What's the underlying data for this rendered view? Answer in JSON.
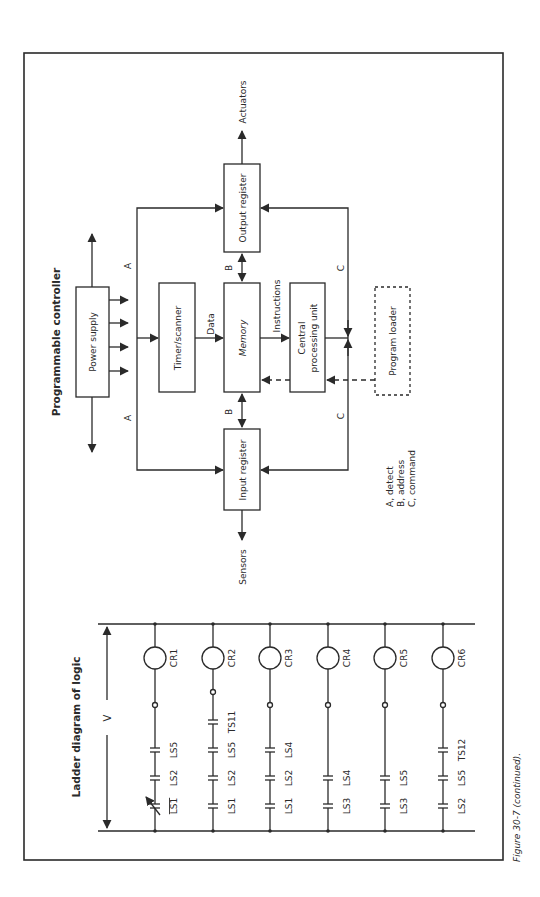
{
  "figure": {
    "caption": "Figure 30-7 (continued).",
    "colors": {
      "line": "#2a2a2a",
      "background": "#ffffff"
    }
  },
  "controller": {
    "title": "Programmable controller",
    "blocks": {
      "power_supply": "Power supply",
      "timer_scanner": "Timer/scanner",
      "memory": "Memory",
      "cpu_line1": "Central",
      "cpu_line2": "processing unit",
      "input_register": "Input register",
      "output_register": "Output register",
      "program_loader": "Program loader"
    },
    "signals": {
      "data": "Data",
      "instructions": "Instructions",
      "sensors": "Sensors",
      "actuators": "Actuators"
    },
    "bus_labels": {
      "a": "A",
      "b": "B",
      "c": "C"
    },
    "legend": [
      "A, detect",
      "B, address",
      "C, command"
    ]
  },
  "ladder": {
    "title": "Ladder diagram of logic",
    "voltage_label": "V",
    "rungs": [
      {
        "coil": "CR1",
        "contacts": [
          "LS1",
          "LS2",
          "LS5"
        ],
        "first_contact_normally_closed": true
      },
      {
        "coil": "CR2",
        "contacts": [
          "LS1",
          "LS2",
          "LS5",
          "TS11"
        ]
      },
      {
        "coil": "CR3",
        "contacts": [
          "LS1",
          "LS2",
          "LS4"
        ]
      },
      {
        "coil": "CR4",
        "contacts": [
          "LS3",
          "LS4"
        ]
      },
      {
        "coil": "CR5",
        "contacts": [
          "LS3",
          "LS5"
        ]
      },
      {
        "coil": "CR6",
        "contacts": [
          "LS2",
          "LS5",
          "TS12"
        ]
      }
    ]
  }
}
